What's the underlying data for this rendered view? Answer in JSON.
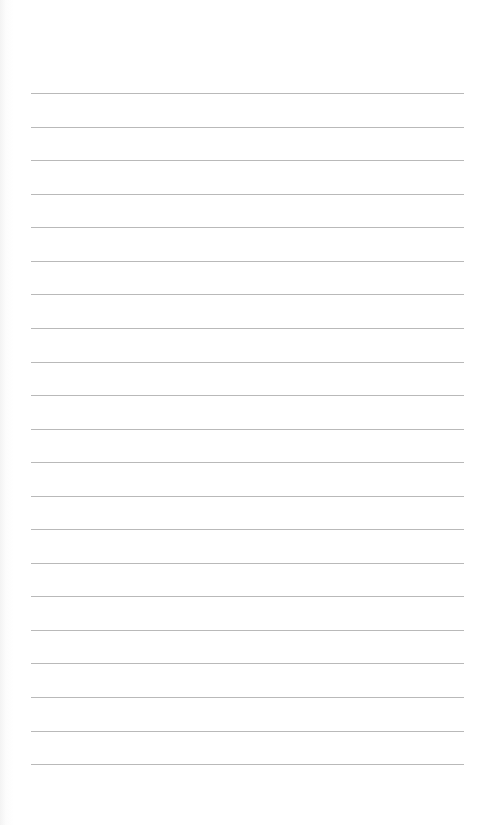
{
  "page": {
    "type": "blank lined notebook page",
    "background_color": "#ffffff",
    "rule_color": "#b9b9b9",
    "rule_count": 21,
    "rule_left_px": 31,
    "rule_right_px": 464,
    "rule_positions_y": [
      93,
      127,
      160,
      194,
      227,
      261,
      294,
      328,
      362,
      395,
      429,
      462,
      496,
      529,
      563,
      596,
      630,
      663,
      697,
      731,
      764
    ]
  }
}
